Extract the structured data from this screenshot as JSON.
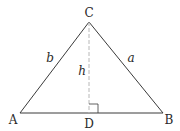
{
  "diagram": {
    "type": "triangle-with-altitude",
    "vertices": {
      "A": {
        "label": "A",
        "x": 20,
        "y": 113
      },
      "B": {
        "label": "B",
        "x": 163,
        "y": 113
      },
      "C": {
        "label": "C",
        "x": 89,
        "y": 22
      },
      "D": {
        "label": "D",
        "x": 89,
        "y": 113
      }
    },
    "sides": {
      "a": {
        "label": "a",
        "from": "C",
        "to": "B"
      },
      "b": {
        "label": "b",
        "from": "A",
        "to": "C"
      }
    },
    "altitude": {
      "label": "h",
      "from": "C",
      "to": "D",
      "style": "dashed"
    },
    "right_angle_marker": {
      "at": "D",
      "size": 9
    },
    "colors": {
      "line": "#3a3a3a",
      "dashed": "#b8b8b8",
      "text": "#2a2a2a"
    }
  }
}
